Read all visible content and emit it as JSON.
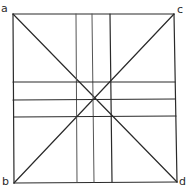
{
  "diagram": {
    "labels": {
      "top_left": "a",
      "top_right": "c",
      "bottom_left": "b",
      "bottom_right": "d"
    },
    "colors": {
      "line": "#2a2a2a",
      "background": "#ffffff"
    },
    "square": {
      "top_left": [
        13,
        14
      ],
      "top_right": [
        174,
        14
      ],
      "bottom_left": [
        14,
        183
      ],
      "bottom_right": [
        177,
        182
      ]
    },
    "diagonals": [
      {
        "from": "a",
        "to": "d"
      },
      {
        "from": "b",
        "to": "c"
      }
    ],
    "vertical_lines_x": [
      77,
      93,
      111
    ],
    "horizontal_lines_y": [
      82,
      100,
      117
    ],
    "center": [
      94,
      98
    ]
  }
}
